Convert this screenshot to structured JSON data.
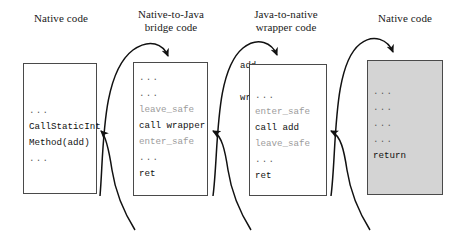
{
  "diagram": {
    "columns": [
      {
        "id": "native-caller",
        "title_line1": "Native code",
        "title_line2": ""
      },
      {
        "id": "bridge",
        "title_line1": "Native-to-Java",
        "title_line2": "bridge code"
      },
      {
        "id": "wrapper",
        "title_line1": "Java-to-native",
        "title_line2": "wrapper code"
      },
      {
        "id": "native-callee",
        "title_line1": "Native code",
        "title_line2": ""
      }
    ],
    "boxes": [
      {
        "id": "native-caller-box",
        "shaded": false,
        "label": "",
        "lines": [
          {
            "text": "",
            "style": "blank"
          },
          {
            "text": "",
            "style": "blank"
          },
          {
            "text": "...",
            "style": "dots"
          },
          {
            "text": "CallStaticInt",
            "style": "normal"
          },
          {
            "text": "Method(add)",
            "style": "normal"
          },
          {
            "text": "...",
            "style": "dots"
          }
        ]
      },
      {
        "id": "bridge-box",
        "shaded": false,
        "label": "",
        "lines": [
          {
            "text": "...",
            "style": "dots"
          },
          {
            "text": "...",
            "style": "dots"
          },
          {
            "text": "leave_safe",
            "style": "muted"
          },
          {
            "text": "call wrapper",
            "style": "normal"
          },
          {
            "text": "enter_safe",
            "style": "muted"
          },
          {
            "text": "...",
            "style": "dots"
          },
          {
            "text": "ret",
            "style": "normal"
          }
        ]
      },
      {
        "id": "wrapper-box",
        "shaded": false,
        "label": "add_\nwrapper:",
        "lines": [
          {
            "text": "",
            "style": "blank"
          },
          {
            "text": "...",
            "style": "dots"
          },
          {
            "text": "enter_safe",
            "style": "muted"
          },
          {
            "text": "call add",
            "style": "normal"
          },
          {
            "text": "leave_safe",
            "style": "muted"
          },
          {
            "text": "...",
            "style": "dots"
          },
          {
            "text": "ret",
            "style": "normal"
          }
        ]
      },
      {
        "id": "native-callee-box",
        "shaded": true,
        "label": "add:",
        "lines": [
          {
            "text": "",
            "style": "blank"
          },
          {
            "text": "...",
            "style": "dots"
          },
          {
            "text": "...",
            "style": "dots"
          },
          {
            "text": "...",
            "style": "dots"
          },
          {
            "text": "...",
            "style": "dots"
          },
          {
            "text": "return",
            "style": "normal"
          }
        ]
      }
    ],
    "jump_labels": [
      {
        "id": "add-wrapper-label",
        "line1": "add_",
        "line2": "wrapper:"
      },
      {
        "id": "add-label",
        "line1": "add:",
        "line2": ""
      }
    ],
    "arrows": [
      {
        "id": "call-bridge-arrow",
        "kind": "call",
        "from": "native-caller-box",
        "to": "bridge-box"
      },
      {
        "id": "return-to-caller-arrow",
        "kind": "return",
        "from": "bridge-box",
        "to": "native-caller-box"
      },
      {
        "id": "call-wrapper-arrow",
        "kind": "call",
        "from": "bridge-box",
        "to": "wrapper-box"
      },
      {
        "id": "return-to-bridge-arrow",
        "kind": "return",
        "from": "wrapper-box",
        "to": "bridge-box"
      },
      {
        "id": "call-add-arrow",
        "kind": "call",
        "from": "wrapper-box",
        "to": "native-callee-box"
      },
      {
        "id": "return-to-wrapper-arrow",
        "kind": "return",
        "from": "native-callee-box",
        "to": "wrapper-box"
      }
    ],
    "colors": {
      "box_border": "#4a4a4a",
      "box_fill": "#ffffff",
      "box_fill_shaded": "#d4d4d4",
      "text": "#111111",
      "text_muted": "#9b9b9b",
      "arrow": "#111111",
      "background": "#ffffff"
    }
  }
}
